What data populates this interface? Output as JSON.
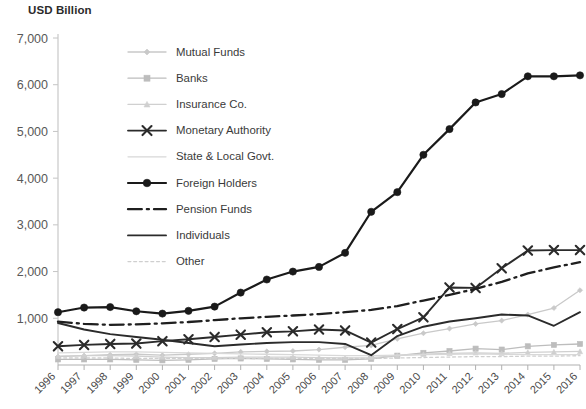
{
  "chart_data": {
    "type": "line",
    "title": "USD Billion",
    "xlabel": "",
    "ylabel": "USD Billion",
    "ylim": [
      0,
      7000
    ],
    "ytick_step": 1000,
    "ytick_labels": [
      "7,000",
      "6,000",
      "5,000",
      "4,000",
      "3,000",
      "2,000",
      "1,000"
    ],
    "ytick_values": [
      7000,
      6000,
      5000,
      4000,
      3000,
      2000,
      1000
    ],
    "grid": false,
    "legend_position": "inside-upper-left",
    "categories": [
      "1996",
      "1997",
      "1998",
      "1999",
      "2000",
      "2001",
      "2002",
      "2003",
      "2004",
      "2005",
      "2006",
      "2007",
      "2008",
      "2009",
      "2010",
      "2011",
      "2012",
      "2013",
      "2014",
      "2015",
      "2016"
    ],
    "x": [
      1996,
      1997,
      1998,
      1999,
      2000,
      2001,
      2002,
      2003,
      2004,
      2005,
      2006,
      2007,
      2008,
      2009,
      2010,
      2011,
      2012,
      2013,
      2014,
      2015,
      2016
    ],
    "series": [
      {
        "name": "Mutual Funds",
        "marker": "diamond",
        "style": "solid",
        "color": "#c9c9c9",
        "values": [
          180,
          200,
          220,
          230,
          210,
          230,
          250,
          280,
          290,
          300,
          330,
          380,
          420,
          560,
          680,
          780,
          880,
          950,
          1080,
          1220,
          1600
        ]
      },
      {
        "name": "Banks",
        "marker": "square",
        "style": "solid",
        "color": "#bdbdbd",
        "values": [
          120,
          120,
          120,
          110,
          100,
          110,
          130,
          140,
          130,
          120,
          110,
          110,
          130,
          200,
          260,
          300,
          350,
          330,
          400,
          430,
          450
        ]
      },
      {
        "name": "Insurance Co.",
        "marker": "triangle",
        "style": "solid",
        "color": "#d0d0d0",
        "values": [
          190,
          200,
          200,
          190,
          170,
          160,
          160,
          170,
          170,
          170,
          160,
          150,
          160,
          200,
          230,
          250,
          260,
          250,
          270,
          280,
          290
        ]
      },
      {
        "name": "Monetary Authority",
        "marker": "x",
        "style": "solid",
        "color": "#2b2b2b",
        "values": [
          400,
          430,
          450,
          460,
          510,
          550,
          600,
          650,
          700,
          720,
          760,
          740,
          480,
          770,
          1020,
          1660,
          1650,
          2070,
          2450,
          2460,
          2460
        ]
      },
      {
        "name": "State & Local  Govt.",
        "marker": "none",
        "style": "solid",
        "color": "#d8d8d8",
        "values": [
          260,
          270,
          280,
          280,
          270,
          260,
          250,
          240,
          230,
          220,
          210,
          200,
          200,
          210,
          220,
          230,
          240,
          230,
          220,
          220,
          220
        ]
      },
      {
        "name": "Foreign Holders",
        "marker": "circle",
        "style": "solid",
        "color": "#1a1a1a",
        "values": [
          1130,
          1230,
          1240,
          1150,
          1100,
          1160,
          1250,
          1550,
          1830,
          2000,
          2100,
          2400,
          3280,
          3700,
          4500,
          5050,
          5620,
          5800,
          6180,
          6180,
          6200
        ]
      },
      {
        "name": "Pension Funds",
        "marker": "none",
        "style": "dashdot",
        "color": "#1f1f1f",
        "values": [
          930,
          880,
          860,
          870,
          890,
          920,
          960,
          1000,
          1030,
          1060,
          1090,
          1130,
          1180,
          1260,
          1380,
          1500,
          1630,
          1780,
          1960,
          2090,
          2200
        ]
      },
      {
        "name": "Individuals",
        "marker": "none",
        "style": "solid",
        "color": "#2b2b2b",
        "values": [
          900,
          760,
          660,
          600,
          540,
          470,
          400,
          440,
          470,
          490,
          490,
          450,
          210,
          620,
          820,
          930,
          1000,
          1080,
          1060,
          840,
          1130
        ]
      },
      {
        "name": "Other",
        "marker": "none",
        "style": "dashed",
        "color": "#cfcfcf",
        "values": [
          150,
          150,
          150,
          140,
          140,
          140,
          140,
          140,
          140,
          140,
          140,
          140,
          140,
          150,
          160,
          170,
          180,
          180,
          190,
          190,
          200
        ]
      }
    ],
    "legend": [
      {
        "label": "Mutual Funds",
        "marker": "diamond",
        "style": "solid",
        "color": "#c9c9c9"
      },
      {
        "label": "Banks",
        "marker": "square",
        "style": "solid",
        "color": "#bdbdbd"
      },
      {
        "label": "Insurance Co.",
        "marker": "triangle",
        "style": "solid",
        "color": "#d0d0d0"
      },
      {
        "label": "Monetary Authority",
        "marker": "x",
        "style": "solid",
        "color": "#2b2b2b"
      },
      {
        "label": "State & Local  Govt.",
        "marker": "none",
        "style": "solid",
        "color": "#d8d8d8"
      },
      {
        "label": "Foreign Holders",
        "marker": "circle",
        "style": "solid",
        "color": "#1a1a1a"
      },
      {
        "label": "Pension Funds",
        "marker": "none",
        "style": "dashdot",
        "color": "#1f1f1f"
      },
      {
        "label": "Individuals",
        "marker": "none",
        "style": "solid",
        "color": "#2b2b2b"
      },
      {
        "label": "Other",
        "marker": "none",
        "style": "dashed",
        "color": "#cfcfcf"
      }
    ]
  }
}
